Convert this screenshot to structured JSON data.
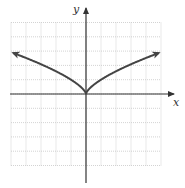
{
  "chart_data": {
    "type": "line",
    "title": "",
    "xlabel": "x",
    "ylabel": "y",
    "xlim": [
      -5,
      5
    ],
    "ylim": [
      -5,
      5
    ],
    "grid": true,
    "grid_step": 1,
    "function": "y = x^(2/3)",
    "series": [
      {
        "name": "curve",
        "x": [
          -5,
          -4,
          -3,
          -2,
          -1,
          -0.5,
          0,
          0.5,
          1,
          2,
          3,
          4,
          5
        ],
        "y": [
          2.92,
          2.52,
          2.08,
          1.59,
          1.0,
          0.63,
          0,
          0.63,
          1.0,
          1.59,
          2.08,
          2.52,
          2.92
        ],
        "arrows": "both-ends"
      }
    ]
  },
  "axes": {
    "x_label": "x",
    "y_label": "y"
  },
  "colors": {
    "grid": "#c8c8c8",
    "axis": "#333333",
    "curve": "#444444"
  }
}
